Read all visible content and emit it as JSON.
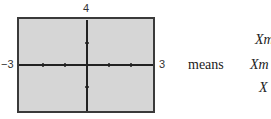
{
  "window": {
    "ymax_label": "4",
    "ymin_label": "−4",
    "xmin_label": "−3",
    "xmax_label": "3",
    "background_color": "#d6d6d6",
    "frame_color": "#3a3a3a"
  },
  "text": {
    "means": "means",
    "lines": [
      "Xm",
      "Xm",
      "X"
    ]
  }
}
